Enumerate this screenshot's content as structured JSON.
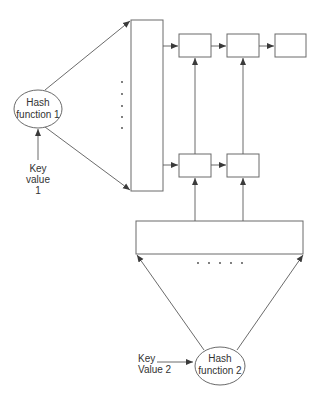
{
  "diagram": {
    "hash_function_1": {
      "line1": "Hash",
      "line2": "function 1"
    },
    "key_value_1": {
      "line1": "Key",
      "line2": "value",
      "line3": "1"
    },
    "hash_function_2": {
      "line1": "Hash",
      "line2": "function 2"
    },
    "key_value_2": {
      "line1": "Key",
      "line2": "Value 2"
    },
    "bucket_array_1": {
      "ellipsis_dots": 5,
      "orientation": "vertical"
    },
    "bucket_array_2": {
      "ellipsis_dots": 5,
      "orientation": "horizontal"
    },
    "chain_top_row": {
      "nodes": 3
    },
    "chain_bottom_row": {
      "nodes": 2
    },
    "colors": {
      "stroke": "#6a6a6a",
      "text": "#333333",
      "background": "#ffffff"
    }
  }
}
